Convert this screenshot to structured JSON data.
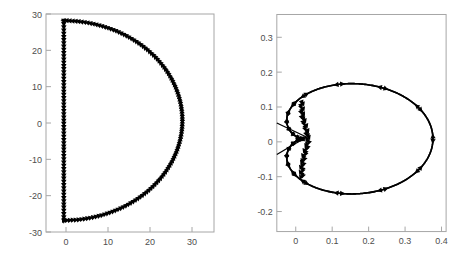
{
  "figure": {
    "title": "",
    "background_color": "#ffffff",
    "curve_color": "#000000",
    "axis_color": "#a6a6a6",
    "tick_label_color": "#4d4d4d",
    "panel_count": 2
  },
  "chart_data": [
    {
      "type": "line",
      "name": "nyquist-d-contour",
      "title": "",
      "xlabel": "",
      "ylabel": "",
      "xlim": [
        -4.5,
        38
      ],
      "ylim": [
        -33.5,
        32
      ],
      "xticks": [
        0,
        10,
        20,
        30
      ],
      "xticklabels": [
        "0",
        "10",
        "20",
        "30"
      ],
      "yticks": [
        -30,
        -20,
        -10,
        0,
        10,
        20,
        30
      ],
      "yticklabels": [
        "-30",
        "-20",
        "-10",
        "0",
        "10",
        "20",
        "30"
      ],
      "grid": false,
      "legend": null,
      "description": "Closed D-shaped Nyquist contour: vertical segment on the imaginary axis from +30 down to -30 at x=0, closed by a semicircular arc of radius 30 bulging to the right to x=30. Dense downward/clockwise arrow markers along entire path.",
      "series": [
        {
          "name": "imaginary-axis-segment",
          "x": [
            0,
            0,
            0,
            0,
            0,
            0,
            0
          ],
          "y": [
            30,
            20,
            10,
            0,
            -10,
            -20,
            -30
          ],
          "direction": "downward"
        },
        {
          "name": "semicircular-arc",
          "radius": 30,
          "center": [
            0,
            0
          ],
          "angle_start_deg": -90,
          "angle_end_deg": 90,
          "x": [
            0,
            15,
            26,
            30,
            26,
            15,
            0
          ],
          "y": [
            -30,
            -26,
            -15,
            0,
            15,
            26,
            30
          ],
          "direction": "counterclockwise-right-half"
        }
      ],
      "marker": {
        "shape": "triangle",
        "count_approx": 190,
        "filled": true
      }
    },
    {
      "type": "line",
      "name": "nyquist-mapped-image",
      "title": "",
      "xlabel": "",
      "ylabel": "",
      "xlim": [
        -0.055,
        0.43
      ],
      "ylim": [
        -0.265,
        0.355
      ],
      "xticks": [
        0,
        0.1,
        0.2,
        0.3,
        0.4
      ],
      "xticklabels": [
        "0",
        "0.1",
        "0.2",
        "0.3",
        "0.4"
      ],
      "yticks": [
        -0.2,
        -0.1,
        0,
        0.1,
        0.2,
        0.3
      ],
      "yticklabels": [
        "-0.2",
        "-0.1",
        "0",
        "0.1",
        "0.2",
        "0.3"
      ],
      "grid": false,
      "legend": null,
      "description": "Two mirror-symmetric lobes (upper and lower) emanating from a dense cluster near the origin, peaking near x=0.37 and y=+/-0.235, plus two thin straight lines crossing through the cluster toward the left edge.",
      "series": [
        {
          "name": "upper-lobe",
          "x": [
            0.02,
            0.06,
            0.12,
            0.21,
            0.3,
            0.36,
            0.37,
            0.33,
            0.25,
            0.15,
            0.06,
            0.02
          ],
          "y": [
            0.02,
            0.13,
            0.2,
            0.235,
            0.225,
            0.17,
            0.08,
            0.02,
            -0.03,
            -0.045,
            -0.02,
            0.01
          ],
          "peak": [
            0.215,
            0.235
          ]
        },
        {
          "name": "lower-lobe",
          "x": [
            0.02,
            0.06,
            0.12,
            0.21,
            0.3,
            0.36,
            0.37,
            0.33,
            0.25,
            0.15,
            0.06,
            0.02
          ],
          "y": [
            -0.02,
            -0.13,
            -0.2,
            -0.235,
            -0.225,
            -0.17,
            -0.08,
            -0.02,
            0.03,
            0.045,
            0.02,
            -0.01
          ],
          "peak": [
            0.215,
            -0.235
          ]
        },
        {
          "name": "crossing-line-upper-left",
          "x": [
            -0.055,
            0.03
          ],
          "y": [
            0.045,
            0.005
          ]
        },
        {
          "name": "crossing-line-lower-left",
          "x": [
            -0.055,
            0.03
          ],
          "y": [
            -0.045,
            0.005
          ]
        }
      ],
      "marker": {
        "shape": "triangle",
        "count_approx": 70,
        "filled": true
      }
    }
  ]
}
